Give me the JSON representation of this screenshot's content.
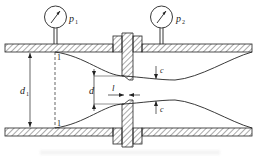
{
  "diagram": {
    "type": "orifice-flow-meter",
    "gauges": [
      {
        "id": "gauge-1",
        "label": "p",
        "subscript": "1"
      },
      {
        "id": "gauge-2",
        "label": "p",
        "subscript": "2"
      }
    ],
    "labels": {
      "pipe_diameter": "d",
      "pipe_diameter_sub": "1",
      "orifice_diameter": "d",
      "plate_thickness": "l",
      "vena_contracta_top": "c",
      "vena_contracta_bottom": "c",
      "section_top": "1",
      "section_bottom": "1"
    },
    "colors": {
      "line": "#222222",
      "hatch": "#555555",
      "background": "#ffffff"
    }
  }
}
